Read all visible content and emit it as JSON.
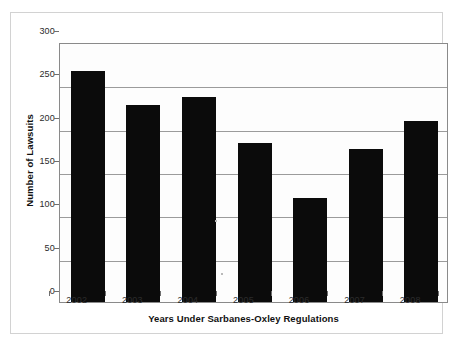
{
  "chart_data": {
    "type": "bar",
    "title": "",
    "xlabel": "Years Under Sarbanes-Oxley Regulations",
    "ylabel": "Number of Lawsuits",
    "categories": [
      "2002",
      "2003",
      "2004",
      "2005",
      "2006",
      "2007",
      "2008"
    ],
    "values": [
      267,
      227,
      237,
      183,
      120,
      176,
      209
    ],
    "series": [
      {
        "name": "Number of Lawsuits",
        "values": [
          267,
          227,
          237,
          183,
          120,
          176,
          209
        ]
      }
    ],
    "ylim": [
      0,
      300
    ],
    "ytick_labels": [
      "0",
      "50",
      "100",
      "150",
      "200",
      "250",
      "300"
    ],
    "ytick_values": [
      0,
      50,
      100,
      150,
      200,
      250,
      300
    ],
    "grid": "horizontal",
    "legend": "none",
    "bar_color": "#0b0b0b",
    "gridline_color": "#9b9b9b",
    "axis_color": "#8a8a8a",
    "plot_background": "#fdfdfd",
    "figure_background": "#ffffff"
  }
}
